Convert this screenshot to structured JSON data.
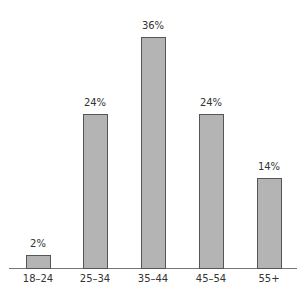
{
  "chart_data": {
    "type": "bar",
    "title": "",
    "xlabel": "",
    "ylabel": "",
    "categories": [
      "18–24",
      "25–34",
      "35–44",
      "45–54",
      "55+"
    ],
    "values": [
      2,
      24,
      36,
      24,
      14
    ],
    "value_labels": [
      "2%",
      "24%",
      "36%",
      "24%",
      "14%"
    ],
    "unit": "%",
    "ylim": [
      0,
      40
    ],
    "grid": false,
    "legend": null,
    "colors": {
      "bar_fill": "#b4b4b4",
      "bar_stroke": "#555555",
      "axis": "#777777",
      "text": "#333333"
    }
  }
}
